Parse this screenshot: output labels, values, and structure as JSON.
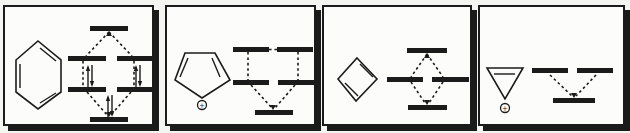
{
  "figure": {
    "ink_color": "#1b1b1b",
    "panel_background": "#fcfcfa",
    "page_background": "#f4f4f1"
  },
  "panels": [
    {
      "molecule": "benzene",
      "charge_label": "",
      "levels": [
        {
          "position": "bottom",
          "degeneracy": 1,
          "electron_pairs_shown": 1
        },
        {
          "position": "lower-middle",
          "degeneracy": 2,
          "electron_pairs_shown": 2
        },
        {
          "position": "upper-middle",
          "degeneracy": 2,
          "electron_pairs_shown": 0
        },
        {
          "position": "top",
          "degeneracy": 1,
          "electron_pairs_shown": 0
        }
      ],
      "primitives": [
        {
          "n": "benzene-ring",
          "t": "poly",
          "pts": [
            [
              33,
              34
            ],
            [
              56,
              53
            ],
            [
              56,
              85
            ],
            [
              33,
              102
            ],
            [
              11,
              85
            ],
            [
              11,
              53
            ]
          ]
        },
        {
          "n": "double-bond-line",
          "t": "line",
          "x1": 35,
          "y1": 41,
          "x2": 51,
          "y2": 54
        },
        {
          "n": "double-bond-line",
          "t": "line",
          "x1": 15,
          "y1": 57,
          "x2": 15,
          "y2": 81
        },
        {
          "n": "double-bond-line",
          "t": "line",
          "x1": 51,
          "y1": 86,
          "x2": 35,
          "y2": 96
        },
        {
          "n": "mo-level-top",
          "t": "bar",
          "x": 85,
          "y": 19,
          "w": 38,
          "h": 5
        },
        {
          "n": "mo-level-upper-left",
          "t": "bar",
          "x": 63,
          "y": 49,
          "w": 38,
          "h": 5
        },
        {
          "n": "mo-level-upper-right",
          "t": "bar",
          "x": 112,
          "y": 49,
          "w": 37,
          "h": 5
        },
        {
          "n": "mo-level-lower-left",
          "t": "bar",
          "x": 63,
          "y": 80,
          "w": 38,
          "h": 5
        },
        {
          "n": "mo-level-lower-right",
          "t": "bar",
          "x": 112,
          "y": 80,
          "w": 37,
          "h": 5
        },
        {
          "n": "mo-level-bottom",
          "t": "bar",
          "x": 85,
          "y": 110,
          "w": 38,
          "h": 5
        },
        {
          "n": "correlation-dash",
          "t": "dash",
          "x1": 104,
          "y1": 25,
          "x2": 81,
          "y2": 49
        },
        {
          "n": "correlation-dash",
          "t": "dash",
          "x1": 104,
          "y1": 25,
          "x2": 127,
          "y2": 49
        },
        {
          "n": "correlation-dash",
          "t": "dash",
          "x1": 78,
          "y1": 54,
          "x2": 78,
          "y2": 80
        },
        {
          "n": "correlation-dash",
          "t": "dash",
          "x1": 129,
          "y1": 54,
          "x2": 129,
          "y2": 80
        },
        {
          "n": "correlation-dash",
          "t": "dash",
          "x1": 82,
          "y1": 85,
          "x2": 102,
          "y2": 108
        },
        {
          "n": "correlation-dash",
          "t": "dash",
          "x1": 126,
          "y1": 85,
          "x2": 106,
          "y2": 108
        },
        {
          "n": "arrowhead-up-icon",
          "t": "ahead",
          "x": 104,
          "y": 25,
          "dir": "up"
        },
        {
          "n": "arrowhead-down-icon",
          "t": "ahead",
          "x": 104,
          "y": 109,
          "dir": "down"
        },
        {
          "n": "electron-pair-arrows",
          "t": "epair",
          "x": 85,
          "yt": 58,
          "yb": 80
        },
        {
          "n": "electron-pair-arrows",
          "t": "epair",
          "x": 133,
          "yt": 58,
          "yb": 80
        },
        {
          "n": "electron-pair-arrows",
          "t": "epair",
          "x": 105,
          "yt": 88,
          "yb": 110
        }
      ]
    },
    {
      "molecule": "cyclopentadienyl cation",
      "charge_label": "+",
      "levels": [
        {
          "position": "bottom",
          "degeneracy": 1,
          "electron_pairs_shown": 0
        },
        {
          "position": "middle",
          "degeneracy": 2,
          "electron_pairs_shown": 0
        },
        {
          "position": "top",
          "degeneracy": 2,
          "electron_pairs_shown": 0
        }
      ],
      "primitives": [
        {
          "n": "cyclopentadienyl-ring",
          "t": "poly",
          "pts": [
            [
              18,
              46
            ],
            [
              48,
              46
            ],
            [
              63,
              73
            ],
            [
              35,
              91
            ],
            [
              8,
              73
            ]
          ]
        },
        {
          "n": "double-bond-line",
          "t": "line",
          "x1": 21,
          "y1": 51,
          "x2": 13,
          "y2": 70
        },
        {
          "n": "double-bond-line",
          "t": "line",
          "x1": 45,
          "y1": 51,
          "x2": 53,
          "y2": 70
        },
        {
          "n": "plus-charge-circle",
          "t": "circle",
          "cx": 35,
          "cy": 98,
          "r": 4.5
        },
        {
          "n": "plus-charge-label",
          "t": "text",
          "x": 35,
          "y": 100.8,
          "s": "+",
          "fs": 7
        },
        {
          "n": "mo-level-top-left",
          "t": "bar",
          "x": 66,
          "y": 40,
          "w": 36,
          "h": 5
        },
        {
          "n": "mo-level-top-right",
          "t": "bar",
          "x": 110,
          "y": 40,
          "w": 36,
          "h": 5
        },
        {
          "n": "degenerate-link-dash",
          "t": "dash",
          "x1": 102,
          "y1": 42.5,
          "x2": 110,
          "y2": 42.5
        },
        {
          "n": "mo-level-mid-left",
          "t": "bar",
          "x": 66,
          "y": 73,
          "w": 36,
          "h": 5
        },
        {
          "n": "mo-level-mid-right",
          "t": "bar",
          "x": 111,
          "y": 73,
          "w": 36,
          "h": 5
        },
        {
          "n": "mo-level-bottom",
          "t": "bar",
          "x": 88,
          "y": 103,
          "w": 38,
          "h": 5
        },
        {
          "n": "correlation-dash",
          "t": "dash",
          "x1": 81,
          "y1": 45,
          "x2": 81,
          "y2": 73
        },
        {
          "n": "correlation-dash",
          "t": "dash",
          "x1": 131,
          "y1": 45,
          "x2": 131,
          "y2": 73
        },
        {
          "n": "correlation-dash",
          "t": "dash",
          "x1": 84,
          "y1": 78,
          "x2": 105,
          "y2": 101
        },
        {
          "n": "correlation-dash",
          "t": "dash",
          "x1": 128,
          "y1": 78,
          "x2": 108,
          "y2": 101
        },
        {
          "n": "arrowhead-down-icon",
          "t": "ahead",
          "x": 106,
          "y": 102,
          "dir": "down"
        }
      ]
    },
    {
      "molecule": "cyclobutadiene",
      "charge_label": "",
      "levels": [
        {
          "position": "bottom",
          "degeneracy": 1,
          "electron_pairs_shown": 0
        },
        {
          "position": "middle",
          "degeneracy": 2,
          "electron_pairs_shown": 0
        },
        {
          "position": "top",
          "degeneracy": 1,
          "electron_pairs_shown": 0
        }
      ],
      "primitives": [
        {
          "n": "cyclobutadiene-ring",
          "t": "poly",
          "pts": [
            [
              33,
              51
            ],
            [
              53,
              72
            ],
            [
              32,
              94
            ],
            [
              14,
              72
            ]
          ]
        },
        {
          "n": "double-bond-line",
          "t": "line",
          "x1": 36,
          "y1": 57,
          "x2": 49,
          "y2": 70
        },
        {
          "n": "double-bond-line",
          "t": "line",
          "x1": 21,
          "y1": 76,
          "x2": 34,
          "y2": 89
        },
        {
          "n": "mo-level-top",
          "t": "bar",
          "x": 83,
          "y": 41,
          "w": 40,
          "h": 5
        },
        {
          "n": "mo-level-mid-left",
          "t": "bar",
          "x": 63,
          "y": 70,
          "w": 36,
          "h": 5
        },
        {
          "n": "mo-level-mid-right",
          "t": "bar",
          "x": 108,
          "y": 70,
          "w": 37,
          "h": 5
        },
        {
          "n": "mo-level-bottom",
          "t": "bar",
          "x": 84,
          "y": 98,
          "w": 39,
          "h": 5
        },
        {
          "n": "correlation-dash",
          "t": "dash",
          "x1": 103,
          "y1": 47,
          "x2": 87,
          "y2": 70
        },
        {
          "n": "correlation-dash",
          "t": "dash",
          "x1": 103,
          "y1": 47,
          "x2": 119,
          "y2": 70
        },
        {
          "n": "correlation-dash",
          "t": "dash",
          "x1": 87,
          "y1": 75,
          "x2": 101,
          "y2": 96
        },
        {
          "n": "correlation-dash",
          "t": "dash",
          "x1": 119,
          "y1": 75,
          "x2": 105,
          "y2": 96
        },
        {
          "n": "arrowhead-up-icon",
          "t": "ahead",
          "x": 103,
          "y": 47,
          "dir": "up"
        },
        {
          "n": "arrowhead-down-icon",
          "t": "ahead",
          "x": 103,
          "y": 97,
          "dir": "down"
        }
      ]
    },
    {
      "molecule": "cyclopropenyl cation",
      "charge_label": "+",
      "levels": [
        {
          "position": "bottom",
          "degeneracy": 1,
          "electron_pairs_shown": 0
        },
        {
          "position": "top",
          "degeneracy": 2,
          "electron_pairs_shown": 0
        }
      ],
      "primitives": [
        {
          "n": "cyclopropenyl-ring",
          "t": "poly",
          "pts": [
            [
              7,
              61
            ],
            [
              43,
              61
            ],
            [
              25,
              92
            ]
          ]
        },
        {
          "n": "double-bond-line",
          "t": "line",
          "x1": 14,
          "y1": 67,
          "x2": 35,
          "y2": 67
        },
        {
          "n": "plus-charge-circle",
          "t": "circle",
          "cx": 25,
          "cy": 101,
          "r": 4.5
        },
        {
          "n": "plus-charge-label",
          "t": "text",
          "x": 25,
          "y": 103.8,
          "s": "+",
          "fs": 7
        },
        {
          "n": "mo-level-top-left",
          "t": "bar",
          "x": 52,
          "y": 61,
          "w": 36,
          "h": 5
        },
        {
          "n": "mo-level-top-right",
          "t": "bar",
          "x": 97,
          "y": 61,
          "w": 36,
          "h": 5
        },
        {
          "n": "mo-level-bottom",
          "t": "bar",
          "x": 73,
          "y": 91,
          "w": 42,
          "h": 5
        },
        {
          "n": "correlation-dash",
          "t": "dash",
          "x1": 70,
          "y1": 68,
          "x2": 92,
          "y2": 89
        },
        {
          "n": "correlation-dash",
          "t": "dash",
          "x1": 116,
          "y1": 68,
          "x2": 96,
          "y2": 89
        },
        {
          "n": "arrowhead-down-icon",
          "t": "ahead",
          "x": 94,
          "y": 90,
          "dir": "down"
        }
      ]
    }
  ]
}
